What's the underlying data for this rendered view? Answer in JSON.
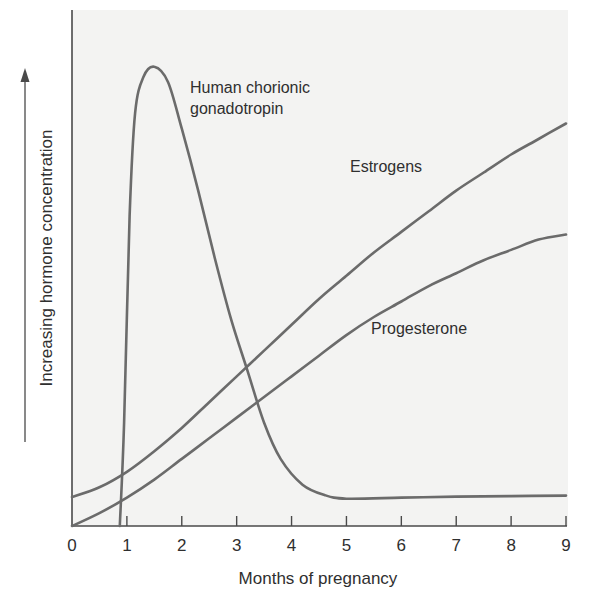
{
  "chart_data": {
    "type": "line",
    "title": "",
    "xlabel": "Months of pregnancy",
    "ylabel": "Increasing hormone concentration",
    "ylabel_has_arrow": true,
    "xlim": [
      0,
      9
    ],
    "ylim": [
      0,
      100
    ],
    "x_ticks": [
      "0",
      "1",
      "2",
      "3",
      "4",
      "5",
      "6",
      "7",
      "8",
      "9"
    ],
    "y_ticks": [],
    "grid": false,
    "legend": "inline labels",
    "series": [
      {
        "name": "Human chorionic gonadotropin",
        "label_lines": [
          "Human chorionic",
          "gonadotropin"
        ],
        "x": [
          0.87,
          0.95,
          1.05,
          1.15,
          1.3,
          1.5,
          1.75,
          2.0,
          2.3,
          2.6,
          2.9,
          3.2,
          3.5,
          3.8,
          4.2,
          4.6,
          5.0,
          6.0,
          7.0,
          8.0,
          9.0
        ],
        "values": [
          0,
          20,
          60,
          80,
          87,
          89,
          86,
          77,
          65,
          52,
          40,
          30,
          20,
          13,
          8,
          6,
          5.3,
          5.5,
          5.7,
          5.8,
          5.9
        ]
      },
      {
        "name": "Estrogens",
        "label_lines": [
          "Estrogens"
        ],
        "x": [
          0,
          0.5,
          1.0,
          1.5,
          2.0,
          2.5,
          3.0,
          3.5,
          4.0,
          4.5,
          5.0,
          5.5,
          6.0,
          6.5,
          7.0,
          7.5,
          8.0,
          8.5,
          9.0
        ],
        "values": [
          5.6,
          7.5,
          10.5,
          14.5,
          19,
          24,
          29,
          34,
          39,
          44,
          48.5,
          53,
          57,
          61,
          65,
          68.5,
          72,
          75,
          78
        ]
      },
      {
        "name": "Progesterone",
        "label_lines": [
          "Progesterone"
        ],
        "x": [
          0,
          0.5,
          1.0,
          1.5,
          2.0,
          2.5,
          3.0,
          3.5,
          4.0,
          4.5,
          5.0,
          5.5,
          6.0,
          6.5,
          7.0,
          7.5,
          8.0,
          8.5,
          9.0
        ],
        "values": [
          0,
          2.5,
          5.5,
          9,
          13,
          17,
          21,
          25,
          29,
          33,
          37,
          40.5,
          43.5,
          46.5,
          49,
          51.5,
          53.5,
          55.5,
          56.5
        ]
      }
    ],
    "colors": {
      "line": "#6b6b6b",
      "axis": "#4a4a4a",
      "plot_background": "#f3f3f2",
      "text": "#2f2f2f"
    }
  }
}
